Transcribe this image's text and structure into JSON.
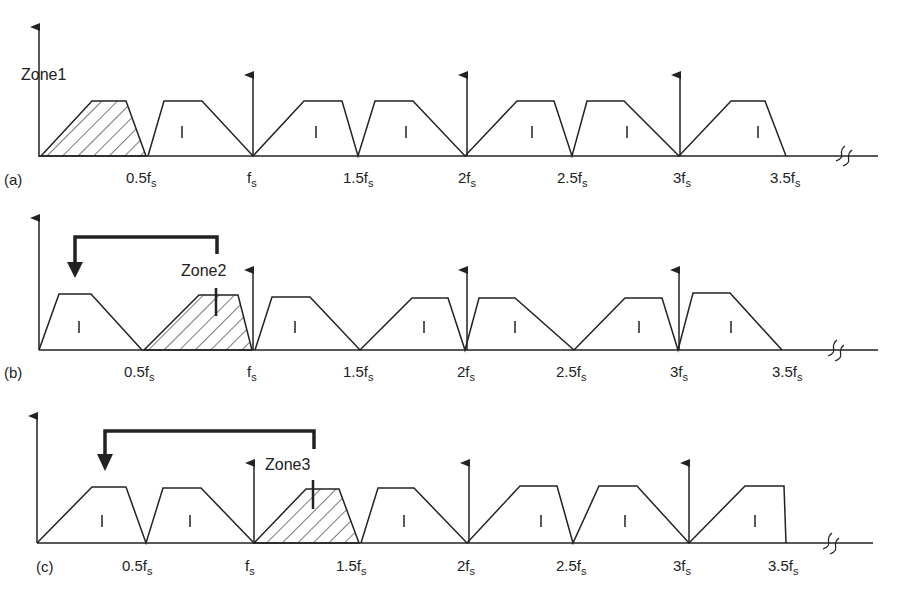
{
  "figure": {
    "tick_labels": [
      "0.5f",
      "f",
      "1.5f",
      "2f",
      "2.5f",
      "3f",
      "3.5f"
    ],
    "tick_subscript": "s",
    "image_marker": "I",
    "panels": [
      {
        "id": "a",
        "label": "(a)",
        "zone_label": "Zone1",
        "signal_band": "0 – 0.5fs (hatched)",
        "has_bracket_arrow": false
      },
      {
        "id": "b",
        "label": "(b)",
        "zone_label": "Zone2",
        "signal_band": "0.5fs – fs (hatched)",
        "has_bracket_arrow": true
      },
      {
        "id": "c",
        "label": "(c)",
        "zone_label": "Zone3",
        "signal_band": "fs – 1.5fs (hatched)",
        "has_bracket_arrow": true
      }
    ],
    "colors": {
      "line": "#222222",
      "background": "#ffffff"
    }
  }
}
